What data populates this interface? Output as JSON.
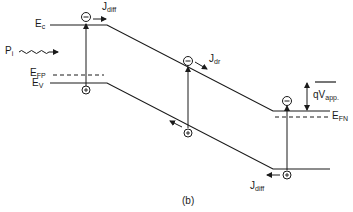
{
  "diagram": {
    "caption": "(b)",
    "labels": {
      "ec": {
        "main": "E",
        "sub": "c"
      },
      "ev": {
        "main": "E",
        "sub": "V"
      },
      "efp": {
        "main": "E",
        "sub": "FP"
      },
      "efn": {
        "main": "E",
        "sub": "FN"
      },
      "pi": {
        "main": "P",
        "sub": "i"
      },
      "jdiff_top": {
        "main": "J",
        "sub": "diff"
      },
      "jdr": {
        "main": "J",
        "sub": "dr"
      },
      "jdiff_bottom": {
        "main": "J",
        "sub": "diff"
      },
      "qvapp": {
        "main": "qV",
        "sub": "app."
      }
    },
    "carriers": {
      "electron_symbol": "⊖",
      "hole_symbol": "⊕"
    },
    "colors": {
      "line": "#1a1a1a",
      "background": "#ffffff"
    }
  }
}
